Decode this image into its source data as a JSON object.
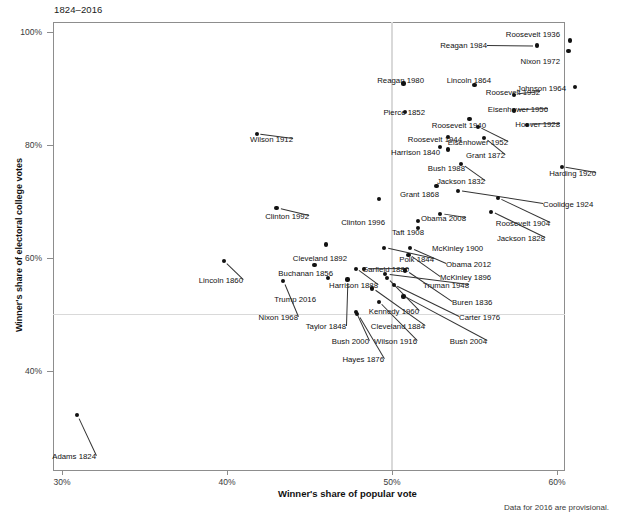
{
  "subtitle": "1824–2016",
  "footnote": "Data for 2016 are provisional.",
  "axis": {
    "xlabel": "Winner's share of popular vote",
    "ylabel": "Winner's share of electoral college votes",
    "xticks": [
      "30%",
      "40%",
      "50%",
      "60%"
    ],
    "yticks": [
      "100%",
      "80%",
      "60%",
      "40%"
    ]
  },
  "chart_data": {
    "type": "scatter",
    "title": "",
    "subtitle": "1824–2016",
    "xlabel": "Winner's share of popular vote",
    "ylabel": "Winner's share of electoral college votes",
    "xlim": [
      29.0,
      62.5
    ],
    "ylim": [
      30.0,
      101.5
    ],
    "xticks": [
      30,
      40,
      50,
      60
    ],
    "yticks": [
      40,
      60,
      80,
      100
    ],
    "grid": false,
    "reference_lines": [
      {
        "orientation": "vertical",
        "value": 50,
        "color": "#d9d9d9"
      },
      {
        "orientation": "horizontal",
        "value": 50,
        "color": "#d9d9d9"
      }
    ],
    "legend": null,
    "annotation": "Data for 2016 are provisional.",
    "point_color": "#111111",
    "points": [
      {
        "label": "Roosevelt 1936",
        "x": 60.8,
        "y": 98.5,
        "lx": 560,
        "ly": 30,
        "anchor": "end"
      },
      {
        "label": "Reagan 1984",
        "x": 58.8,
        "y": 97.6,
        "lx": 487,
        "ly": 41,
        "anchor": "end"
      },
      {
        "label": "Nixon 1972",
        "x": 60.7,
        "y": 96.7,
        "lx": 560,
        "ly": 57,
        "anchor": "end"
      },
      {
        "label": "Johnson 1964",
        "x": 61.1,
        "y": 90.3,
        "lx": 566,
        "ly": 84,
        "anchor": "end"
      },
      {
        "label": "Reagan 1980",
        "x": 50.7,
        "y": 90.9,
        "lx": 424,
        "ly": 76,
        "anchor": "end"
      },
      {
        "label": "Lincoln 1864",
        "x": 55.0,
        "y": 90.6,
        "lx": 491,
        "ly": 76,
        "anchor": "end"
      },
      {
        "label": "Roosevelt 1932",
        "x": 57.4,
        "y": 88.9,
        "lx": 540,
        "ly": 88,
        "anchor": "end"
      },
      {
        "label": "Pierce 1852",
        "x": 50.8,
        "y": 85.8,
        "lx": 425,
        "ly": 108,
        "anchor": "end"
      },
      {
        "label": "Eisenhower 1956",
        "x": 57.4,
        "y": 86.1,
        "lx": 548,
        "ly": 105,
        "anchor": "end"
      },
      {
        "label": "Hoover 1928",
        "x": 58.2,
        "y": 83.6,
        "lx": 560,
        "ly": 120,
        "anchor": "end"
      },
      {
        "label": "Roosevelt 1940",
        "x": 54.7,
        "y": 84.6,
        "lx": 486,
        "ly": 121,
        "anchor": "end"
      },
      {
        "label": "Roosevelt 1944",
        "x": 53.4,
        "y": 81.4,
        "lx": 462,
        "ly": 135,
        "anchor": "end"
      },
      {
        "label": "Eisenhower 1952",
        "x": 55.2,
        "y": 83.2,
        "lx": 508,
        "ly": 138,
        "anchor": "end"
      },
      {
        "label": "Wilson 1912",
        "x": 41.8,
        "y": 81.9,
        "lx": 293,
        "ly": 135,
        "anchor": "end"
      },
      {
        "label": "Harrison 1840",
        "x": 52.9,
        "y": 79.6,
        "lx": 440,
        "ly": 148,
        "anchor": "end"
      },
      {
        "label": "Grant 1872",
        "x": 55.6,
        "y": 81.2,
        "lx": 505,
        "ly": 151,
        "anchor": "end"
      },
      {
        "label": "Bush 1988",
        "x": 53.4,
        "y": 79.2,
        "lx": 465,
        "ly": 164,
        "anchor": "end"
      },
      {
        "label": "Jackson 1832",
        "x": 54.2,
        "y": 76.6,
        "lx": 485,
        "ly": 177,
        "anchor": "end"
      },
      {
        "label": "Harding 1920",
        "x": 60.3,
        "y": 76.1,
        "lx": 596,
        "ly": 169,
        "anchor": "end"
      },
      {
        "label": "Grant 1868",
        "x": 52.7,
        "y": 72.8,
        "lx": 439,
        "ly": 190,
        "anchor": "end"
      },
      {
        "label": "Coolidge 1924",
        "x": 54.0,
        "y": 71.9,
        "lx": 543,
        "ly": 200,
        "anchor": "start"
      },
      {
        "label": "Clinton 1992",
        "x": 43.0,
        "y": 68.8,
        "lx": 309,
        "ly": 212,
        "anchor": "end"
      },
      {
        "label": "Clinton 1996",
        "x": 49.2,
        "y": 70.4,
        "lx": 385,
        "ly": 218,
        "anchor": "end"
      },
      {
        "label": "Obama 2008",
        "x": 52.9,
        "y": 67.8,
        "lx": 466,
        "ly": 214,
        "anchor": "end"
      },
      {
        "label": "Roosevelt 1904",
        "x": 56.4,
        "y": 70.6,
        "lx": 550,
        "ly": 219,
        "anchor": "end"
      },
      {
        "label": "Taft 1908",
        "x": 51.6,
        "y": 66.5,
        "lx": 424,
        "ly": 228,
        "anchor": "end"
      },
      {
        "label": "Jackson 1828",
        "x": 56.0,
        "y": 68.2,
        "lx": 545,
        "ly": 234,
        "anchor": "end"
      },
      {
        "label": "McKinley 1900",
        "x": 51.6,
        "y": 65.3,
        "lx": 432,
        "ly": 244,
        "anchor": "start"
      },
      {
        "label": "Cleveland 1892",
        "x": 46.0,
        "y": 62.4,
        "lx": 347,
        "ly": 254,
        "anchor": "end"
      },
      {
        "label": "Garfield 1880",
        "x": 48.3,
        "y": 58.0,
        "lx": 409,
        "ly": 265,
        "anchor": "end"
      },
      {
        "label": "Polk 1844",
        "x": 49.5,
        "y": 61.8,
        "lx": 434,
        "ly": 255,
        "anchor": "end"
      },
      {
        "label": "Obama 2012",
        "x": 51.1,
        "y": 61.7,
        "lx": 446,
        "ly": 260,
        "anchor": "start"
      },
      {
        "label": "McKinley 1896",
        "x": 51.0,
        "y": 60.6,
        "lx": 440,
        "ly": 273,
        "anchor": "start"
      },
      {
        "label": "Buchanan 1856",
        "x": 45.3,
        "y": 58.8,
        "lx": 333,
        "ly": 269,
        "anchor": "end"
      },
      {
        "label": "Lincoln 1860",
        "x": 39.8,
        "y": 59.4,
        "lx": 243,
        "ly": 276,
        "anchor": "end"
      },
      {
        "label": "Truman 1948",
        "x": 49.6,
        "y": 57.1,
        "lx": 469,
        "ly": 281,
        "anchor": "end"
      },
      {
        "label": "Harrison 1888",
        "x": 47.8,
        "y": 58.1,
        "lx": 378,
        "ly": 281,
        "anchor": "end"
      },
      {
        "label": "Buren 1836",
        "x": 50.8,
        "y": 57.8,
        "lx": 452,
        "ly": 298,
        "anchor": "start"
      },
      {
        "label": "Trump 2016",
        "x": 46.1,
        "y": 56.5,
        "lx": 316,
        "ly": 295,
        "anchor": "end"
      },
      {
        "label": "Nixon 1968",
        "x": 43.4,
        "y": 55.9,
        "lx": 298,
        "ly": 313,
        "anchor": "end"
      },
      {
        "label": "Kennedy 1960",
        "x": 49.7,
        "y": 56.4,
        "lx": 419,
        "ly": 307,
        "anchor": "end"
      },
      {
        "label": "Carter 1976",
        "x": 50.1,
        "y": 55.2,
        "lx": 459,
        "ly": 313,
        "anchor": "start"
      },
      {
        "label": "Taylor 1848",
        "x": 47.3,
        "y": 56.2,
        "lx": 346,
        "ly": 322,
        "anchor": "end"
      },
      {
        "label": "Cleveland 1884",
        "x": 48.8,
        "y": 54.6,
        "lx": 425,
        "ly": 322,
        "anchor": "end"
      },
      {
        "label": "Bush 2000",
        "x": 47.8,
        "y": 50.4,
        "lx": 369,
        "ly": 337,
        "anchor": "end"
      },
      {
        "label": "Wilson 1916",
        "x": 49.2,
        "y": 52.2,
        "lx": 417,
        "ly": 337,
        "anchor": "end"
      },
      {
        "label": "Bush 2004",
        "x": 50.7,
        "y": 53.2,
        "lx": 487,
        "ly": 337,
        "anchor": "end"
      },
      {
        "label": "Hayes 1876",
        "x": 47.9,
        "y": 50.1,
        "lx": 384,
        "ly": 355,
        "anchor": "end"
      },
      {
        "label": "Adams 1824",
        "x": 30.9,
        "y": 32.2,
        "lx": 96,
        "ly": 452,
        "anchor": "end"
      }
    ]
  }
}
